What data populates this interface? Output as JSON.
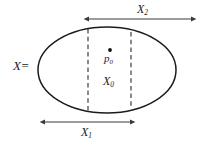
{
  "figure": {
    "labels": {
      "set_name": "X",
      "equals_sign": "=",
      "x2": "X",
      "x2_sub": "2",
      "x1": "X",
      "x1_sub": "1",
      "x0": "X",
      "x0_sub": "0",
      "p0": "p",
      "p0_sub": "0"
    },
    "colors": {
      "outline": "#1c1c1c",
      "dashed": "#2b2b2b",
      "arrow": "#3a3a3a",
      "point": "#111111",
      "background": "#ffffff"
    }
  },
  "chart_data": {
    "type": "diagram",
    "title": "",
    "shapes": [
      {
        "name": "region-ellipse",
        "kind": "ellipse",
        "label": "X",
        "cx": 107,
        "cy": 70,
        "rx": 69,
        "ry": 43
      },
      {
        "name": "dashed-chord-left",
        "kind": "vertical-dashed-line",
        "x": 88,
        "y_top": 29,
        "y_bottom": 111
      },
      {
        "name": "dashed-chord-right",
        "kind": "vertical-dashed-line",
        "x": 131,
        "y_top": 32,
        "y_bottom": 108
      },
      {
        "name": "point-p0",
        "kind": "point",
        "label": "p0",
        "x": 110,
        "y": 50
      }
    ],
    "measures": [
      {
        "name": "X2",
        "label": "X2",
        "kind": "double-arrow",
        "y": 19,
        "x_start": 88,
        "x_end": 192,
        "label_x": 144,
        "label_y": 9
      },
      {
        "name": "X1",
        "label": "X1",
        "kind": "double-arrow",
        "y": 122,
        "x_start": 44,
        "x_end": 131,
        "label_x": 87,
        "label_y": 132
      }
    ],
    "regions": [
      {
        "name": "X0",
        "label": "X0",
        "kind": "vertical-strip",
        "x_left": 88,
        "x_right": 131,
        "label_x": 109,
        "label_y": 81
      }
    ]
  }
}
